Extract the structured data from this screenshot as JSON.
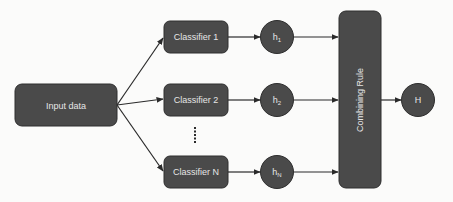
{
  "diagram": {
    "type": "ensemble-classifier-flow",
    "colors": {
      "node_fill": "#4a4a4a",
      "node_stroke": "#2e2e2e",
      "text": "#e6e6e6",
      "edge": "#2a2a2a",
      "background": "#fbfbfa"
    },
    "input": {
      "label": "Input data"
    },
    "classifiers": [
      {
        "label": "Classifier 1"
      },
      {
        "label": "Classifier 2"
      },
      {
        "label": "Classifier N"
      }
    ],
    "ellipsis": "......",
    "hypotheses": [
      {
        "label": "h",
        "subscript": "1"
      },
      {
        "label": "h",
        "subscript": "2"
      },
      {
        "label": "h",
        "subscript": "N"
      }
    ],
    "combiner": {
      "label": "Combining Rule"
    },
    "output": {
      "label": "H"
    }
  }
}
